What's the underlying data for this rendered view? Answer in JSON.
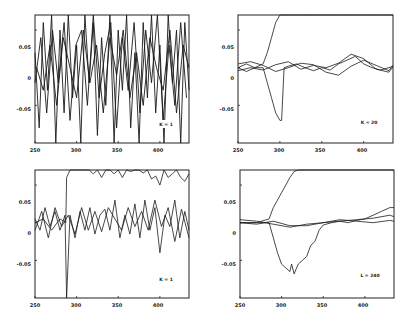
{
  "chart_data": [
    {
      "type": "line",
      "panel": "top-left",
      "annotation": "K = 1",
      "xlabel": "",
      "ylabel": "",
      "xlim": [
        250,
        435
      ],
      "ylim": [
        -0.1,
        0.07
      ],
      "xticks": [
        "250",
        "300",
        "350",
        "400"
      ],
      "yticks": [
        "0.05",
        "0",
        "-0.05"
      ],
      "grid": false,
      "description": "Dense high-frequency oscillations spanning full vertical range",
      "series": [
        {
          "name": "series-1",
          "x": [
            250,
            255,
            260,
            265,
            270,
            275,
            280,
            285,
            290,
            295,
            300,
            305,
            310,
            315,
            320,
            325,
            330,
            335,
            340,
            345,
            350,
            355,
            360,
            365,
            370,
            375,
            380,
            385,
            390,
            395,
            400,
            405,
            410,
            415,
            420,
            425,
            430,
            435
          ],
          "values": [
            0.02,
            -0.08,
            0.06,
            -0.03,
            0.07,
            -0.1,
            0.05,
            -0.06,
            0.07,
            -0.04,
            0.03,
            -0.1,
            0.07,
            -0.02,
            0.06,
            -0.09,
            0.04,
            -0.05,
            0.07,
            -0.1,
            0.05,
            -0.03,
            0.07,
            -0.08,
            0.02,
            -0.1,
            0.06,
            -0.04,
            0.07,
            -0.06,
            0.03,
            -0.1,
            0.07,
            -0.02,
            0.05,
            -0.1,
            0.06,
            -0.03
          ]
        },
        {
          "name": "series-2",
          "x": [
            250,
            257,
            264,
            271,
            278,
            285,
            292,
            299,
            306,
            313,
            320,
            327,
            334,
            341,
            348,
            355,
            362,
            369,
            376,
            383,
            390,
            397,
            404,
            411,
            418,
            425,
            432
          ],
          "values": [
            -0.02,
            0.04,
            -0.06,
            0.05,
            -0.02,
            0.06,
            -0.07,
            0.03,
            0.05,
            -0.05,
            0.07,
            -0.04,
            0.02,
            0.06,
            -0.08,
            0.04,
            -0.03,
            0.06,
            -0.06,
            0.05,
            -0.02,
            0.07,
            -0.07,
            0.03,
            -0.05,
            0.06,
            -0.04
          ]
        },
        {
          "name": "series-3",
          "x": [
            252,
            260,
            268,
            276,
            284,
            292,
            300,
            308,
            316,
            324,
            332,
            340,
            348,
            356,
            364,
            372,
            380,
            388,
            396,
            404,
            412,
            420,
            428,
            435
          ],
          "values": [
            0.0,
            -0.03,
            0.03,
            -0.05,
            0.04,
            0.0,
            -0.04,
            0.05,
            -0.02,
            0.03,
            -0.06,
            0.04,
            -0.01,
            0.05,
            -0.04,
            0.02,
            -0.05,
            0.04,
            0.0,
            -0.03,
            0.05,
            -0.06,
            0.03,
            0.0
          ]
        }
      ]
    },
    {
      "type": "line",
      "panel": "top-right",
      "annotation": "K = 20",
      "xlabel": "",
      "ylabel": "",
      "xlim": [
        250,
        435
      ],
      "ylim": [
        -0.1,
        0.07
      ],
      "xticks": [
        "250",
        "300",
        "350",
        "400"
      ],
      "yticks": [
        "0.05",
        "0",
        "-0.05"
      ],
      "grid": false,
      "series": [
        {
          "name": "rising",
          "x": [
            250,
            260,
            270,
            280,
            285,
            290,
            295,
            300,
            310,
            320,
            330,
            340,
            350,
            355,
            360,
            370,
            380,
            390,
            400,
            410,
            420,
            430,
            435
          ],
          "values": [
            0.0,
            0.005,
            0.0,
            0.005,
            0.02,
            0.04,
            0.06,
            0.075,
            0.077,
            0.078,
            0.082,
            0.085,
            0.083,
            0.075,
            0.074,
            0.076,
            0.08,
            0.077,
            0.079,
            0.075,
            0.074,
            0.073,
            0.075
          ]
        },
        {
          "name": "dipping",
          "x": [
            250,
            260,
            270,
            280,
            285,
            290,
            295,
            300,
            302,
            305,
            310,
            320,
            330,
            340,
            350,
            360,
            370,
            380,
            390,
            400,
            410,
            420,
            430,
            435
          ],
          "values": [
            0.0,
            -0.005,
            0.0,
            0.0,
            -0.02,
            -0.04,
            -0.06,
            -0.07,
            -0.07,
            0.0,
            0.002,
            0.005,
            0.0,
            -0.004,
            0.0,
            -0.003,
            0.005,
            0.01,
            0.015,
            0.005,
            0.0,
            -0.003,
            0.0,
            0.002
          ]
        },
        {
          "name": "flat-a",
          "x": [
            250,
            265,
            280,
            295,
            310,
            325,
            340,
            355,
            370,
            385,
            400,
            415,
            430,
            435
          ],
          "values": [
            0.005,
            0.008,
            0.003,
            -0.005,
            0.0,
            0.006,
            0.004,
            -0.006,
            -0.01,
            0.002,
            0.01,
            0.003,
            -0.004,
            0.003
          ]
        },
        {
          "name": "flat-b",
          "x": [
            250,
            265,
            280,
            295,
            310,
            325,
            340,
            355,
            370,
            385,
            400,
            415,
            430,
            435
          ],
          "values": [
            -0.004,
            0.0,
            -0.003,
            0.004,
            0.008,
            -0.002,
            0.003,
            0.0,
            0.006,
            0.018,
            0.012,
            -0.002,
            -0.006,
            0.001
          ]
        }
      ]
    },
    {
      "type": "line",
      "panel": "bottom-left",
      "annotation": "K = 1",
      "xlabel": "",
      "ylabel": "",
      "xlim": [
        250,
        435
      ],
      "ylim": [
        -0.1,
        0.07
      ],
      "xticks": [
        "250",
        "300",
        "350",
        "400"
      ],
      "yticks": [
        "0.05",
        "0",
        "-0.05"
      ],
      "grid": false,
      "series": [
        {
          "name": "rising-noisy",
          "x": [
            250,
            260,
            270,
            280,
            287,
            288,
            292,
            296,
            300,
            305,
            310,
            315,
            320,
            325,
            330,
            335,
            340,
            345,
            350,
            355,
            360,
            365,
            370,
            375,
            380,
            385,
            390,
            395,
            400,
            405,
            410,
            415,
            420,
            425,
            430,
            435
          ],
          "values": [
            0.0,
            0.005,
            -0.01,
            0.005,
            0.0,
            0.06,
            0.07,
            0.08,
            0.075,
            0.085,
            0.07,
            0.08,
            0.065,
            0.078,
            0.06,
            0.082,
            0.07,
            0.065,
            0.08,
            0.06,
            0.072,
            0.068,
            0.085,
            0.07,
            0.066,
            0.07,
            0.058,
            0.062,
            0.05,
            0.07,
            0.06,
            0.065,
            0.09,
            0.06,
            0.055,
            0.065
          ]
        },
        {
          "name": "noise-a",
          "x": [
            250,
            256,
            262,
            268,
            274,
            280,
            286,
            288,
            292,
            298,
            304,
            310,
            316,
            322,
            328,
            334,
            340,
            346,
            352,
            358,
            364,
            370,
            376,
            382,
            388,
            394,
            400,
            406,
            412,
            418,
            424,
            430,
            435
          ],
          "values": [
            0.005,
            -0.01,
            0.02,
            -0.005,
            0.015,
            -0.01,
            0.01,
            -0.1,
            0.01,
            -0.02,
            0.015,
            -0.01,
            0.02,
            -0.015,
            0.01,
            0.018,
            -0.01,
            0.03,
            -0.02,
            0.01,
            -0.015,
            0.025,
            -0.02,
            0.03,
            -0.01,
            0.02,
            -0.04,
            0.01,
            -0.005,
            0.03,
            -0.02,
            0.015,
            -0.01
          ]
        },
        {
          "name": "noise-b",
          "x": [
            250,
            258,
            266,
            274,
            282,
            290,
            298,
            306,
            314,
            322,
            330,
            338,
            346,
            354,
            362,
            370,
            378,
            386,
            394,
            402,
            410,
            418,
            426,
            435
          ],
          "values": [
            -0.01,
            0.015,
            -0.02,
            0.02,
            -0.005,
            0.01,
            -0.015,
            0.02,
            -0.01,
            0.015,
            -0.012,
            0.02,
            0.005,
            -0.01,
            0.02,
            -0.005,
            0.015,
            -0.01,
            0.03,
            -0.005,
            0.02,
            -0.025,
            0.018,
            -0.02
          ]
        }
      ]
    },
    {
      "type": "line",
      "panel": "bottom-right",
      "annotation": "L = 240",
      "xlabel": "",
      "ylabel": "",
      "xlim": [
        250,
        435
      ],
      "ylim": [
        -0.1,
        0.07
      ],
      "xticks": [
        "250",
        "300",
        "350",
        "400"
      ],
      "yticks": [
        "0.05",
        "0",
        "-0.05"
      ],
      "grid": false,
      "series": [
        {
          "name": "rising-smooth",
          "x": [
            250,
            270,
            285,
            290,
            295,
            300,
            305,
            310,
            315,
            320,
            330,
            340,
            350,
            360,
            370,
            380,
            390,
            400,
            410,
            420,
            430,
            435
          ],
          "values": [
            0.0,
            0.0,
            0.005,
            0.02,
            0.03,
            0.04,
            0.05,
            0.06,
            0.068,
            0.072,
            0.076,
            0.08,
            0.08,
            0.081,
            0.082,
            0.083,
            0.084,
            0.085,
            0.086,
            0.086,
            0.085,
            0.085
          ]
        },
        {
          "name": "dip-recover",
          "x": [
            250,
            270,
            285,
            290,
            295,
            300,
            305,
            310,
            312,
            315,
            318,
            320,
            325,
            330,
            335,
            340,
            345,
            350,
            360,
            370,
            380,
            390,
            400,
            410,
            420,
            430,
            435
          ],
          "values": [
            0.0,
            0.0,
            0.0,
            -0.02,
            -0.04,
            -0.055,
            -0.06,
            -0.065,
            -0.055,
            -0.068,
            -0.06,
            -0.055,
            -0.05,
            -0.045,
            -0.03,
            -0.025,
            -0.01,
            -0.003,
            0.0,
            0.002,
            0.0,
            0.003,
            0.005,
            0.01,
            0.015,
            0.02,
            0.02
          ]
        },
        {
          "name": "flat-a",
          "x": [
            250,
            270,
            290,
            310,
            330,
            350,
            370,
            390,
            410,
            430,
            435
          ],
          "values": [
            0.004,
            0.002,
            -0.002,
            -0.006,
            -0.002,
            0.0,
            0.004,
            0.002,
            0.0,
            0.003,
            0.002
          ]
        },
        {
          "name": "flat-b",
          "x": [
            250,
            270,
            290,
            310,
            330,
            350,
            370,
            390,
            410,
            430,
            435
          ],
          "values": [
            0.0,
            -0.002,
            0.002,
            -0.004,
            -0.004,
            0.0,
            0.002,
            0.004,
            0.006,
            0.01,
            0.008
          ]
        }
      ]
    }
  ],
  "panels": [
    {
      "annotation": "K = 1",
      "xticks": [
        "250",
        "300",
        "350",
        "400"
      ],
      "yticks": [
        "0.05",
        "0",
        "-0.05"
      ]
    },
    {
      "annotation": "K = 20",
      "xticks": [
        "250",
        "300",
        "350",
        "400"
      ],
      "yticks": [
        "0.05",
        "0",
        "-0.05"
      ]
    },
    {
      "annotation": "K = 1",
      "xticks": [
        "250",
        "300",
        "350",
        "400"
      ],
      "yticks": [
        "0.05",
        "0",
        "-0.05"
      ]
    },
    {
      "annotation": "L = 240",
      "xticks": [
        "250",
        "300",
        "350",
        "400"
      ],
      "yticks": [
        "0.05",
        "0",
        "-0.05"
      ]
    }
  ]
}
